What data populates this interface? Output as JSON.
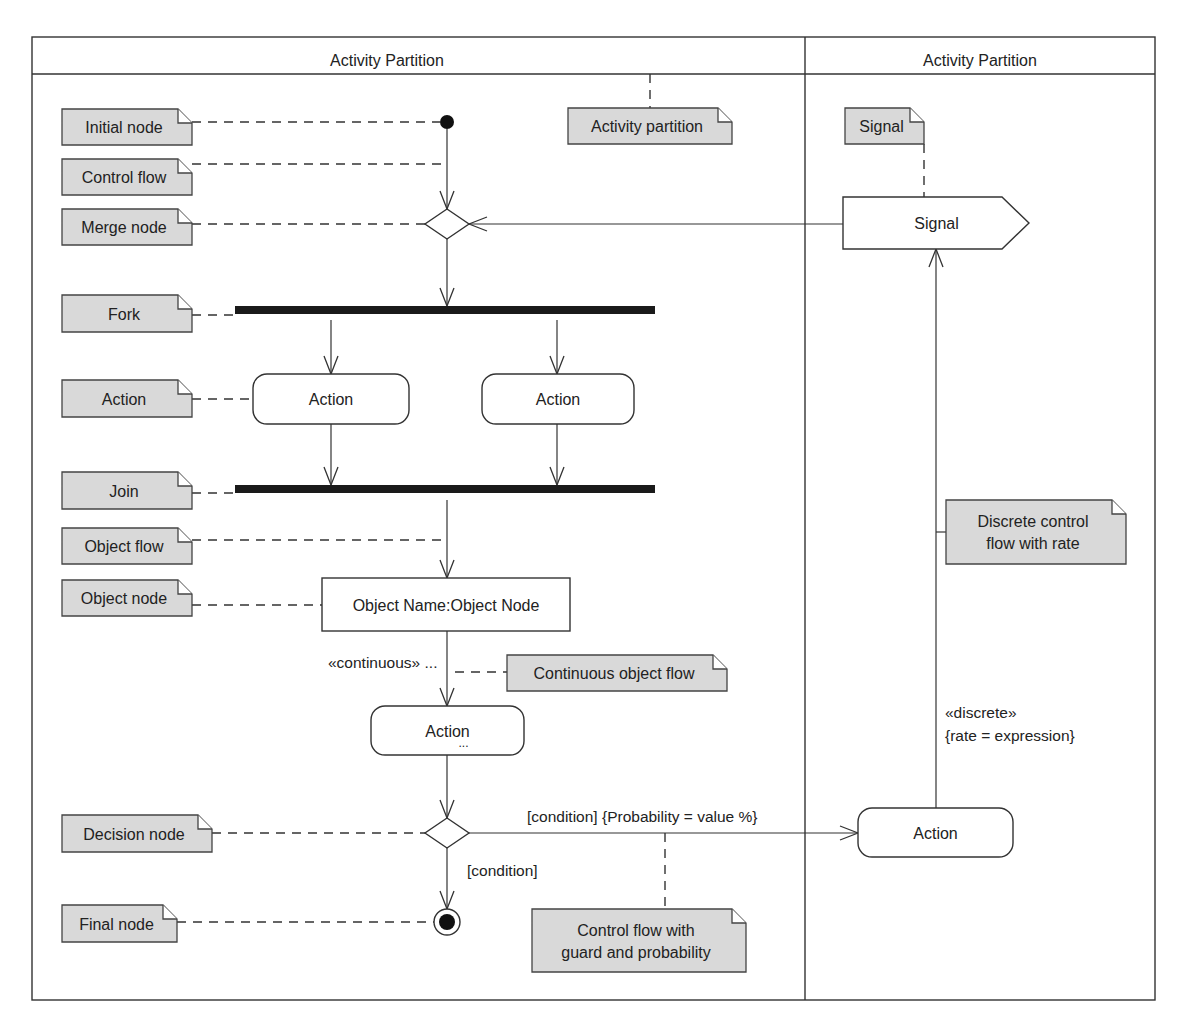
{
  "frame": {
    "x": 32,
    "y": 37,
    "w": 1123,
    "h": 963,
    "header_bottom": 74,
    "divider_x": 805
  },
  "partitions": [
    {
      "label": "Activity Partition",
      "cx": 387
    },
    {
      "label": "Activity Partition",
      "cx": 980
    }
  ],
  "colors": {
    "note_fill": "#d9d9d9",
    "line": "#333333",
    "bar": "#1a1a1a"
  },
  "notes": [
    {
      "id": "initial-node",
      "label": [
        "Initial node"
      ],
      "x": 62,
      "y": 109,
      "w": 130,
      "h": 36
    },
    {
      "id": "control-flow",
      "label": [
        "Control flow"
      ],
      "x": 62,
      "y": 159,
      "w": 130,
      "h": 36
    },
    {
      "id": "merge-node",
      "label": [
        "Merge node"
      ],
      "x": 62,
      "y": 209,
      "w": 130,
      "h": 36
    },
    {
      "id": "fork",
      "label": [
        "Fork"
      ],
      "x": 62,
      "y": 295,
      "w": 130,
      "h": 37
    },
    {
      "id": "action",
      "label": [
        "Action"
      ],
      "x": 62,
      "y": 380,
      "w": 130,
      "h": 37
    },
    {
      "id": "join",
      "label": [
        "Join"
      ],
      "x": 62,
      "y": 472,
      "w": 130,
      "h": 37
    },
    {
      "id": "object-flow",
      "label": [
        "Object flow"
      ],
      "x": 62,
      "y": 528,
      "w": 130,
      "h": 36
    },
    {
      "id": "object-node",
      "label": [
        "Object node"
      ],
      "x": 62,
      "y": 580,
      "w": 130,
      "h": 36
    },
    {
      "id": "decision-node",
      "label": [
        "Decision node"
      ],
      "x": 62,
      "y": 815,
      "w": 150,
      "h": 37
    },
    {
      "id": "final-node",
      "label": [
        "Final node"
      ],
      "x": 62,
      "y": 905,
      "w": 115,
      "h": 37
    },
    {
      "id": "activity-partition",
      "label": [
        "Activity partition"
      ],
      "x": 568,
      "y": 108,
      "w": 164,
      "h": 36
    },
    {
      "id": "signal",
      "label": [
        "Signal"
      ],
      "x": 845,
      "y": 108,
      "w": 79,
      "h": 36
    },
    {
      "id": "continuous-object-flow",
      "label": [
        "Continuous object flow"
      ],
      "x": 507,
      "y": 655,
      "w": 220,
      "h": 36
    },
    {
      "id": "discrete-control-flow",
      "label": [
        "Discrete control",
        "flow with rate"
      ],
      "x": 946,
      "y": 500,
      "w": 180,
      "h": 64
    },
    {
      "id": "control-flow-guard",
      "label": [
        "Control flow with",
        "guard and probability"
      ],
      "x": 532,
      "y": 909,
      "w": 214,
      "h": 63
    }
  ],
  "nodes": {
    "initial": {
      "cx": 447,
      "cy": 122,
      "r": 7
    },
    "merge": {
      "cx": 447,
      "cy": 224,
      "hw": 22,
      "hh": 15
    },
    "fork": {
      "x": 235,
      "y": 306,
      "w": 420,
      "h": 8
    },
    "action_left": {
      "label": "Action",
      "x": 253,
      "y": 374,
      "w": 156,
      "h": 50,
      "rx": 14
    },
    "action_right": {
      "label": "Action",
      "x": 482,
      "y": 374,
      "w": 152,
      "h": 50,
      "rx": 14
    },
    "join": {
      "x": 235,
      "y": 485,
      "w": 420,
      "h": 8
    },
    "object_node": {
      "label": "Object Name:Object Node",
      "x": 322,
      "y": 578,
      "w": 248,
      "h": 53
    },
    "action_mid": {
      "label": "Action",
      "sub": "...",
      "x": 371,
      "y": 706,
      "w": 153,
      "h": 49,
      "rx": 14
    },
    "decision": {
      "cx": 447,
      "cy": 833,
      "hw": 22,
      "hh": 15
    },
    "final": {
      "cx": 447,
      "cy": 922,
      "r": 13,
      "r_inner": 8
    },
    "signal": {
      "label": "Signal",
      "x": 843,
      "y": 197,
      "w": 159,
      "h": 52,
      "tip": 27
    },
    "action_far": {
      "label": "Action",
      "x": 858,
      "y": 808,
      "w": 155,
      "h": 49,
      "rx": 14
    }
  },
  "edge_labels": {
    "continuous": "«continuous» ...",
    "condition_probability": "[condition] {Probability = value %}",
    "condition": "[condition]",
    "discrete": "«discrete»",
    "rate": "{rate = expression}"
  },
  "faint_top_text": "..."
}
